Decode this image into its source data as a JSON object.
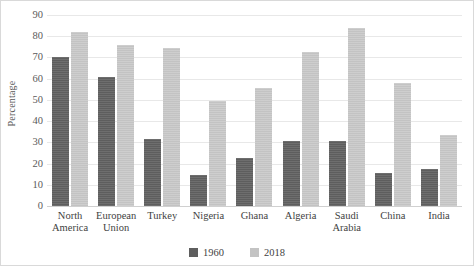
{
  "chart_data": {
    "type": "bar",
    "title": "",
    "xlabel": "",
    "ylabel": "Percentage",
    "ylim": [
      0,
      90
    ],
    "ytick_step": 10,
    "yticks": [
      0,
      10,
      20,
      30,
      40,
      50,
      60,
      70,
      80,
      90
    ],
    "grid": true,
    "legend_position": "bottom",
    "categories": [
      "North America",
      "European Union",
      "Turkey",
      "Nigeria",
      "Ghana",
      "Algeria",
      "Saudi Arabia",
      "China",
      "India"
    ],
    "category_lines": [
      [
        "North",
        "America"
      ],
      [
        "European",
        "Union"
      ],
      [
        "Turkey",
        ""
      ],
      [
        "Nigeria",
        ""
      ],
      [
        "Ghana",
        ""
      ],
      [
        "Algeria",
        ""
      ],
      [
        "Saudi",
        "Arabia"
      ],
      [
        "China",
        ""
      ],
      [
        "India",
        ""
      ]
    ],
    "series": [
      {
        "name": "1960",
        "color": "#5e5e5e",
        "values": [
          70,
          61,
          31.5,
          14.5,
          22.5,
          30.5,
          30.5,
          15.5,
          17.5
        ]
      },
      {
        "name": "2018",
        "color": "#c3c3c3",
        "values": [
          82,
          76,
          74.5,
          49.5,
          55.5,
          72.5,
          84,
          58,
          33.5
        ]
      }
    ]
  },
  "legend": {
    "items": [
      {
        "label": "1960"
      },
      {
        "label": "2018"
      }
    ]
  }
}
